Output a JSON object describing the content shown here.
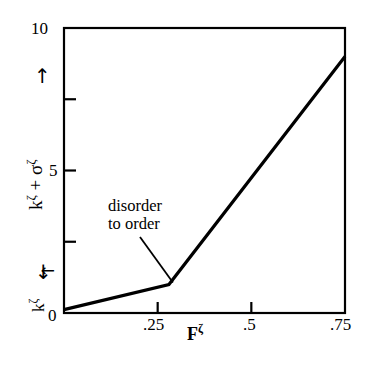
{
  "chart_data": {
    "type": "line",
    "title": "",
    "subtitle": "",
    "xlabel": "Fζ",
    "ylabel": "kζ + σζ",
    "xlim": [
      0,
      0.75
    ],
    "ylim": [
      0,
      10
    ],
    "grid": false,
    "legend": "none",
    "xticks": [
      0,
      0.25,
      0.5,
      0.75
    ],
    "xticklabels": [
      "0",
      ".25",
      ".5",
      ".75"
    ],
    "yticks": [
      0,
      2.5,
      5,
      7.5,
      10
    ],
    "yticklabels": [
      "0",
      "",
      "5",
      "",
      "10"
    ],
    "series": [
      {
        "name": "k+sigma vs F",
        "x": [
          0,
          0.28,
          0.75
        ],
        "values": [
          0.12,
          1.0,
          9.0
        ]
      }
    ],
    "annotations": [
      {
        "name": "disorder-to-order",
        "line1": "disorder",
        "line2": "to order",
        "points_to_x": 0.28,
        "points_to_y": 1.0
      }
    ]
  },
  "axes": {
    "y_axis_label_main": "k",
    "y_axis_label_sup1": "ζ",
    "y_axis_label_plus": " + σ",
    "y_axis_label_sup2": "ζ",
    "x_axis_label_main": "F",
    "x_axis_label_sup": "ζ",
    "origin_label": "0",
    "y_top_label": "10",
    "y_mid_label": "5",
    "x_tick_1": ".25",
    "x_tick_2": ".5",
    "x_tick_3": ".75",
    "up_arrow": "↑",
    "down_arrow": "↓",
    "k_marker_main": "k",
    "k_marker_sup": "ζ",
    "k_marker_arrow": "↑"
  },
  "annotation": {
    "line1": "disorder",
    "line2": "to order"
  },
  "colors": {
    "background": "#ffffff",
    "foreground": "#000000",
    "data_line": "#000000"
  }
}
